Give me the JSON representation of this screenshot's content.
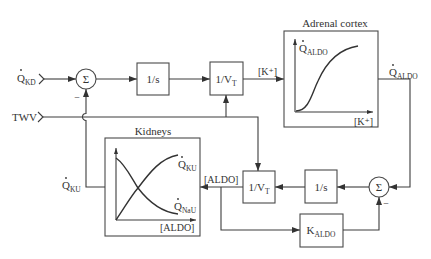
{
  "diagram": {
    "inputs": {
      "potassium_intake": {
        "symbol": "Q",
        "overdot": true,
        "sub": "KD"
      },
      "twv": {
        "label": "TWV"
      }
    },
    "summing_junction_top": {
      "symbol": "Σ",
      "minus": "−"
    },
    "integrator_top": {
      "label": "1/s"
    },
    "volume_divider_top": {
      "main": "1/V",
      "sub": "T"
    },
    "potassium_concentration_label": "[K⁺]",
    "adrenal_cortex": {
      "title": "Adrenal cortex",
      "y_axis": {
        "symbol": "Q",
        "overdot": true,
        "sub": "ALDO"
      },
      "x_axis": "[K⁺]",
      "curve": "sigmoid"
    },
    "aldosterone_output": {
      "symbol": "Q",
      "overdot": true,
      "sub": "ALDO"
    },
    "summing_junction_bottom": {
      "symbol": "Σ",
      "minus": "−"
    },
    "integrator_bottom": {
      "label": "1/s"
    },
    "volume_divider_bottom": {
      "main": "1/V",
      "sub": "T"
    },
    "aldosterone_concentration_label": "[ALDO]",
    "clearance_block": {
      "main": "K",
      "sub": "ALDO"
    },
    "kidneys": {
      "title": "Kidneys",
      "curve_rising": {
        "symbol": "Q",
        "overdot": true,
        "sub": "KU"
      },
      "curve_falling": {
        "symbol": "Q",
        "overdot": true,
        "sub": "NaU"
      },
      "x_axis": "[ALDO]"
    },
    "potassium_excretion": {
      "symbol": "Q",
      "overdot": true,
      "sub": "KU"
    }
  },
  "colors": {
    "stroke": "#3c3c3c",
    "text": "#333333",
    "background": "#ffffff"
  }
}
